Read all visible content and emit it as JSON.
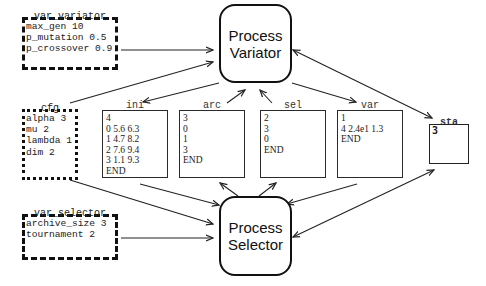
{
  "processes": {
    "variator": {
      "line1": "Process",
      "line2": "Variator"
    },
    "selector": {
      "line1": "Process",
      "line2": "Selector"
    }
  },
  "params": {
    "var_variator": {
      "title": "var_variator",
      "lines": "max_gen 10\np_mutation 0.5\np_crossover 0.9"
    },
    "cfg": {
      "title": "cfg",
      "lines": "alpha 3\nmu 2\nlambda 1\ndim 2"
    },
    "var_selector": {
      "title": "var_selector",
      "lines": "archive_size 3\ntournament 2"
    }
  },
  "files": {
    "ini": {
      "title": "ini",
      "lines": "4\n0 5.6 6.3\n1 4.7 8.2\n2 7.6 9.4\n3 1.1 9.3\nEND"
    },
    "arc": {
      "title": "arc",
      "lines": "3\n0\n1\n3\nEND"
    },
    "sel": {
      "title": "sel",
      "lines": "2\n3\n0\nEND"
    },
    "var": {
      "title": "var",
      "lines": "1\n4 2.4e1 1.3\nEND"
    },
    "sta": {
      "title": "sta",
      "value": "3"
    }
  },
  "edges": [
    {
      "from": "var_variator",
      "to": "process_variator"
    },
    {
      "from": "cfg",
      "to": "process_variator"
    },
    {
      "from": "process_variator",
      "to": "ini"
    },
    {
      "from": "arc",
      "to": "process_variator"
    },
    {
      "from": "sel",
      "to": "process_variator"
    },
    {
      "from": "process_variator",
      "to": "var"
    },
    {
      "from": "process_variator",
      "to": "sta",
      "bidirectional": true
    },
    {
      "from": "cfg",
      "to": "process_selector"
    },
    {
      "from": "ini",
      "to": "process_selector"
    },
    {
      "from": "var_selector",
      "to": "process_selector"
    },
    {
      "from": "process_selector",
      "to": "arc"
    },
    {
      "from": "process_selector",
      "to": "sel"
    },
    {
      "from": "var",
      "to": "process_selector"
    },
    {
      "from": "process_selector",
      "to": "sta",
      "bidirectional": true
    }
  ]
}
